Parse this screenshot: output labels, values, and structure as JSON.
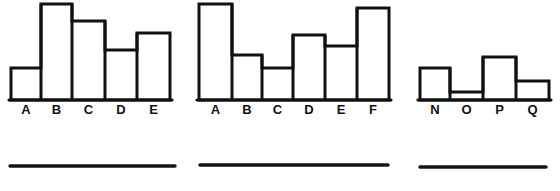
{
  "page": {
    "background_color": "#ffffff",
    "ink_color": "#111111",
    "width": 560,
    "height": 191
  },
  "chart_data": [
    {
      "type": "bar",
      "name": "histogram-left",
      "title": "",
      "xlabel": "",
      "ylabel": "",
      "categories": [
        "A",
        "B",
        "C",
        "D",
        "E"
      ],
      "values": [
        32,
        96,
        79,
        50,
        67
      ],
      "ylim": [
        0,
        100
      ],
      "grid": false,
      "legend": "none",
      "bar_pixel_tops": [
        68,
        4,
        21,
        50,
        33
      ],
      "baseline_y": 100,
      "bar_edges_x": [
        11,
        41,
        72,
        105,
        137,
        170
      ],
      "label_y": 114,
      "caption_rule": {
        "x1": 10,
        "x2": 175,
        "y": 166
      }
    },
    {
      "type": "bar",
      "name": "histogram-middle",
      "title": "",
      "xlabel": "",
      "ylabel": "",
      "categories": [
        "A",
        "B",
        "C",
        "D",
        "E",
        "F"
      ],
      "values": [
        96,
        47,
        33,
        68,
        56,
        92
      ],
      "ylim": [
        0,
        100
      ],
      "grid": false,
      "legend": "none",
      "bar_pixel_tops": [
        4,
        55,
        68,
        35,
        46,
        8
      ],
      "baseline_y": 100,
      "bar_edges_x": [
        199,
        232,
        262,
        293,
        325,
        357,
        389
      ],
      "label_y": 114,
      "caption_rule": {
        "x1": 200,
        "x2": 388,
        "y": 165
      }
    },
    {
      "type": "bar",
      "name": "histogram-right",
      "title": "",
      "xlabel": "",
      "ylabel": "",
      "categories": [
        "N",
        "O",
        "P",
        "Q"
      ],
      "values": [
        33,
        8,
        44,
        20
      ],
      "ylim": [
        0,
        100
      ],
      "grid": false,
      "legend": "none",
      "bar_pixel_tops": [
        68,
        92,
        57,
        81
      ],
      "baseline_y": 100,
      "bar_edges_x": [
        420,
        450,
        483,
        516,
        549
      ],
      "label_y": 114,
      "caption_rule": {
        "x1": 420,
        "x2": 546,
        "y": 167
      }
    }
  ]
}
